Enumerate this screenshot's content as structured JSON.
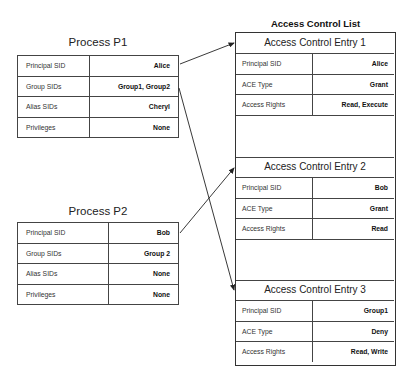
{
  "processes": [
    {
      "title": "Process P1",
      "rows": [
        {
          "label": "Principal SID",
          "value": "Alice"
        },
        {
          "label": "Group SIDs",
          "value": "Group1, Group2"
        },
        {
          "label": "Alias SIDs",
          "value": "Cheryl"
        },
        {
          "label": "Privileges",
          "value": "None"
        }
      ]
    },
    {
      "title": "Process P2",
      "rows": [
        {
          "label": "Principal SID",
          "value": "Bob"
        },
        {
          "label": "Group SIDs",
          "value": "Group 2"
        },
        {
          "label": "Alias SIDs",
          "value": "None"
        },
        {
          "label": "Privileges",
          "value": "None"
        }
      ]
    }
  ],
  "acl": {
    "title": "Access Control List",
    "entries": [
      {
        "title": "Access Control Entry 1",
        "rows": [
          {
            "label": "Principal SID",
            "value": "Alice"
          },
          {
            "label": "ACE Type",
            "value": "Grant"
          },
          {
            "label": "Access Rights",
            "value": "Read, Execute"
          }
        ]
      },
      {
        "title": "Access Control Entry 2",
        "rows": [
          {
            "label": "Principal SID",
            "value": "Bob"
          },
          {
            "label": "ACE Type",
            "value": "Grant"
          },
          {
            "label": "Access Rights",
            "value": "Read"
          }
        ]
      },
      {
        "title": "Access Control Entry 3",
        "rows": [
          {
            "label": "Principal SID",
            "value": "Group1"
          },
          {
            "label": "ACE Type",
            "value": "Deny"
          },
          {
            "label": "Access Rights",
            "value": "Read, Write"
          }
        ]
      }
    ]
  },
  "arrows": [
    {
      "from": "P1.Principal SID",
      "to": "Access Control Entry 1"
    },
    {
      "from": "P1.Group SIDs",
      "to": "Access Control Entry 3"
    },
    {
      "from": "P2.Principal SID",
      "to": "Access Control Entry 2"
    }
  ]
}
